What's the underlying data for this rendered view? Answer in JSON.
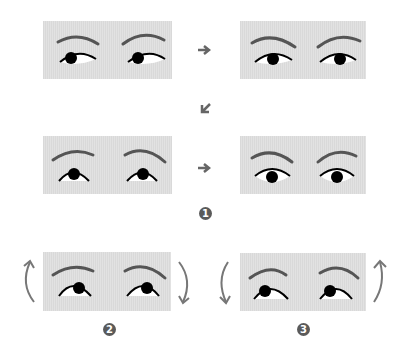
{
  "figure": {
    "colors": {
      "panel_bg": "#dedede",
      "brow": "#5a5a5a",
      "eye_outline": "#000000",
      "pupil": "#000000",
      "eye_white": "#ffffff",
      "arrow": "#6a6a6a",
      "badge": "#5a5a5a"
    },
    "panels": [
      {
        "id": "p1",
        "gaze": "left-down",
        "x": 43,
        "y": 21
      },
      {
        "id": "p2",
        "gaze": "center-down",
        "x": 240,
        "y": 21
      },
      {
        "id": "p3",
        "gaze": "up",
        "x": 43,
        "y": 136
      },
      {
        "id": "p4",
        "gaze": "center",
        "x": 240,
        "y": 136
      },
      {
        "id": "p5",
        "gaze": "up-right",
        "x": 43,
        "y": 252
      },
      {
        "id": "p6",
        "gaze": "up-left",
        "x": 240,
        "y": 252
      }
    ],
    "arrows": [
      {
        "id": "a1",
        "direction": "right",
        "glyph": "right-arrow-icon"
      },
      {
        "id": "a2",
        "direction": "down-left",
        "glyph": "down-left-arrow-icon"
      },
      {
        "id": "a3",
        "direction": "right",
        "glyph": "right-arrow-icon"
      }
    ],
    "steps": [
      {
        "label": "1"
      },
      {
        "label": "2"
      },
      {
        "label": "3"
      }
    ],
    "rotations": [
      {
        "step": "2",
        "left": "counterclockwise-up",
        "right": "clockwise-down"
      },
      {
        "step": "3",
        "left": "clockwise-down",
        "right": "counterclockwise-up"
      }
    ]
  }
}
